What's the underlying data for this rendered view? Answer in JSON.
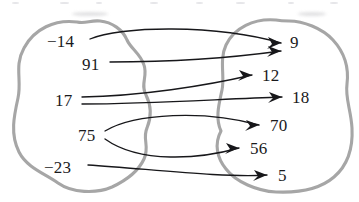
{
  "diagram": {
    "type": "mapping-diagram",
    "colors": {
      "set_outline": "#a6a6a6",
      "arrow": "#17171a",
      "label": "#1a1a1c",
      "background": "#ffffff"
    },
    "left_set": {
      "name": "domain-set",
      "elements": [
        {
          "id": "src-neg14",
          "label": "−14",
          "x": 47,
          "y": 33
        },
        {
          "id": "src-91",
          "label": "91",
          "x": 82,
          "y": 56
        },
        {
          "id": "src-17",
          "label": "17",
          "x": 55,
          "y": 92
        },
        {
          "id": "src-75",
          "label": "75",
          "x": 78,
          "y": 127
        },
        {
          "id": "src-neg23",
          "label": "−23",
          "x": 44,
          "y": 159
        }
      ]
    },
    "right_set": {
      "name": "codomain-set",
      "elements": [
        {
          "id": "dst-9",
          "label": "9",
          "x": 290,
          "y": 34
        },
        {
          "id": "dst-12",
          "label": "12",
          "x": 262,
          "y": 67
        },
        {
          "id": "dst-18",
          "label": "18",
          "x": 292,
          "y": 89
        },
        {
          "id": "dst-70",
          "label": "70",
          "x": 270,
          "y": 117
        },
        {
          "id": "dst-56",
          "label": "56",
          "x": 250,
          "y": 140
        },
        {
          "id": "dst-5",
          "label": "5",
          "x": 278,
          "y": 167
        }
      ]
    },
    "mappings": [
      {
        "id": "arrow-neg14-to-9",
        "from": "−14",
        "to": "9",
        "path": "M 90 39 C 120 26, 215 24, 281 43"
      },
      {
        "id": "arrow-91-to-9",
        "from": "91",
        "to": "9",
        "path": "M 110 62 C 170 62, 230 58, 281 51"
      },
      {
        "id": "arrow-17-to-12",
        "from": "17",
        "to": "12",
        "path": "M 82 97 C 140 96, 205 86, 252 75"
      },
      {
        "id": "arrow-17-to-18",
        "from": "17",
        "to": "18",
        "path": "M 82 104 C 150 104, 220 99, 282 97"
      },
      {
        "id": "arrow-75-to-70",
        "from": "75",
        "to": "70",
        "path": "M 105 131 C 135 113, 205 110, 259 125"
      },
      {
        "id": "arrow-75-to-56",
        "from": "75",
        "to": "56",
        "path": "M 105 139 C 140 164, 200 159, 239 148"
      },
      {
        "id": "arrow-neg23-to-5",
        "from": "−23",
        "to": "5",
        "path": "M 88 165 C 150 169, 225 178, 267 175"
      }
    ],
    "arrow_heads": [
      {
        "id": "head-9-upper",
        "points": "281,43 268,37 272,44 267,49"
      },
      {
        "id": "head-9-lower",
        "points": "281,51 268,46 272,52 267,57"
      },
      {
        "id": "head-12",
        "points": "252,75 239,70 243,76 238,81"
      },
      {
        "id": "head-18",
        "points": "282,97 269,92 273,98 268,103"
      },
      {
        "id": "head-70",
        "points": "259,125 246,120 250,126 245,131"
      },
      {
        "id": "head-56",
        "points": "239,148 226,143 230,149 225,154"
      },
      {
        "id": "head-5",
        "points": "267,175 254,170 258,176 253,181"
      }
    ],
    "left_blob_path": "M 77 22 C 55 19, 34 29, 24 48 C 14 66, 22 80, 18 98 C 14 116, 10 134, 19 152 C 27 168, 46 174, 58 183 C 72 193, 96 194, 112 187 C 127 180, 138 172, 144 159 C 150 146, 142 139, 147 128 C 152 116, 151 105, 146 95 C 140 84, 148 76, 144 65 C 140 53, 131 49, 127 40 C 123 30, 112 22, 100 21 C 90 20, 86 24, 77 22 Z",
    "right_blob_path": "M 276 20 C 254 18, 234 28, 226 45 C 219 60, 225 76, 222 90 C 219 104, 215 118, 221 131 C 214 144, 217 158, 226 169 C 236 182, 257 191, 276 192 C 298 193, 320 189, 334 177 C 348 165, 353 147, 352 128 C 351 110, 345 98, 347 84 C 349 68, 344 52, 333 40 C 322 28, 303 21, 289 21 C 283 21, 281 21, 276 20 Z"
  }
}
